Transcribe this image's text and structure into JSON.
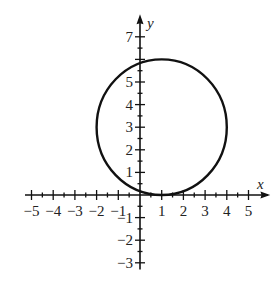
{
  "chart_data": {
    "type": "line",
    "title": "",
    "xlabel": "x",
    "ylabel": "y",
    "xlim": [
      -5,
      5
    ],
    "ylim": [
      -3,
      7
    ],
    "x_ticks": [
      -5,
      -4,
      -3,
      -2,
      -1,
      1,
      2,
      3,
      4,
      5
    ],
    "y_ticks": [
      -3,
      -2,
      -1,
      1,
      2,
      3,
      4,
      5,
      7
    ],
    "x_tick_labels": [
      "−5",
      "−4",
      "−3",
      "−2",
      "−1",
      "1",
      "2",
      "3",
      "4",
      "5"
    ],
    "y_tick_labels": [
      "−3",
      "−2",
      "−1",
      "1",
      "2",
      "3",
      "4",
      "5",
      "7"
    ],
    "minor_ticks": 0.5,
    "grid": false,
    "legend": null,
    "series": [
      {
        "name": "circle",
        "shape": "circle",
        "center": [
          1,
          3
        ],
        "radius": 3,
        "equation": "(x-1)^2 + (y-3)^2 = 9"
      }
    ]
  },
  "axes": {
    "x_label": "x",
    "y_label": "y"
  }
}
